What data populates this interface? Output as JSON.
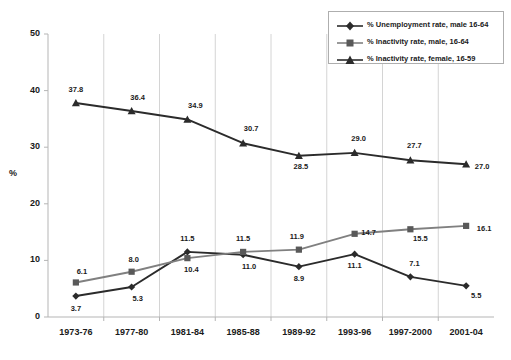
{
  "axis": {
    "ylabel": "%",
    "yticks": [
      "0",
      "10",
      "20",
      "30",
      "40",
      "50"
    ],
    "xticks": [
      "1973-76",
      "1977-80",
      "1981-84",
      "1985-88",
      "1989-92",
      "1993-96",
      "1997-2000",
      "2001-04"
    ]
  },
  "legend": {
    "items": [
      {
        "label": "% Unemployment rate, male 16-64",
        "marker": "diamond-marker",
        "color": "#2b2b2b"
      },
      {
        "label": "% Inactivity rate, male, 16-64",
        "marker": "square-marker",
        "color": "#808080"
      },
      {
        "label": "% Inactivity rate, female, 16-59",
        "marker": "triangle-marker",
        "color": "#2b2b2b"
      }
    ]
  },
  "labels": {
    "unemployment": [
      "3.7",
      "5.3",
      "11.5",
      "11.0",
      "8.9",
      "11.1",
      "7.1",
      "5.5"
    ],
    "inactivity_male": [
      "6.1",
      "8.0",
      "10.4",
      "11.5",
      "11.9",
      "14.7",
      "15.5",
      "16.1"
    ],
    "inactivity_female": [
      "37.8",
      "36.4",
      "34.9",
      "30.7",
      "28.5",
      "29.0",
      "27.7",
      "27.0"
    ]
  },
  "chart_data": {
    "type": "line",
    "title": "",
    "xlabel": "",
    "ylabel": "%",
    "ylim": [
      0,
      50
    ],
    "yticks": [
      0,
      10,
      20,
      30,
      40,
      50
    ],
    "grid": "vertical-only",
    "legend_position": "top-right",
    "categories": [
      "1973-76",
      "1977-80",
      "1981-84",
      "1985-88",
      "1989-92",
      "1993-96",
      "1997-2000",
      "2001-04"
    ],
    "series": [
      {
        "name": "% Unemployment rate, male 16-64",
        "marker": "diamond",
        "color": "#2b2b2b",
        "values": [
          3.7,
          5.3,
          11.5,
          11.0,
          8.9,
          11.1,
          7.1,
          5.5
        ]
      },
      {
        "name": "% Inactivity rate, male, 16-64",
        "marker": "square",
        "color": "#808080",
        "values": [
          6.1,
          8.0,
          10.4,
          11.5,
          11.9,
          14.7,
          15.5,
          16.1
        ]
      },
      {
        "name": "% Inactivity rate, female, 16-59",
        "marker": "triangle",
        "color": "#2b2b2b",
        "values": [
          37.8,
          36.4,
          34.9,
          30.7,
          28.5,
          29.0,
          27.7,
          27.0
        ]
      }
    ]
  }
}
